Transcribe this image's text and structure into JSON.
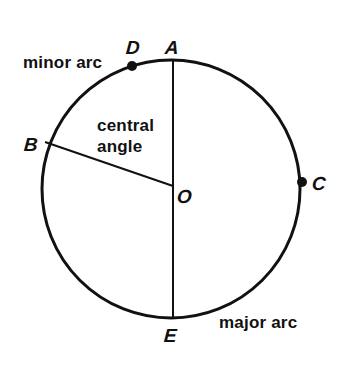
{
  "diagram": {
    "points": {
      "A": "A",
      "B": "B",
      "C": "C",
      "D": "D",
      "E": "E",
      "O": "O"
    },
    "labels": {
      "minor_arc": "minor arc",
      "major_arc": "major arc",
      "central_angle_line1": "central",
      "central_angle_line2": "angle"
    },
    "geometry": {
      "center": [
        171,
        189
      ],
      "radius": 129,
      "stroke_color": "#111111"
    }
  }
}
